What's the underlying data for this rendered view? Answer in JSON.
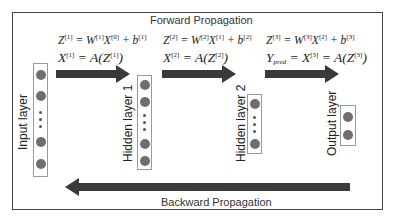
{
  "diagram": {
    "forward_label": "Forward Propagation",
    "backward_label": "Backward Propagation",
    "layers": [
      {
        "label": "Input layer",
        "nodes_top": 2,
        "nodes_bottom": 2,
        "ellipsis": true
      },
      {
        "label": "Hidden layer 1",
        "nodes_top": 2,
        "nodes_bottom": 2,
        "ellipsis": true
      },
      {
        "label": "Hidden layer 2",
        "nodes_top": 1,
        "nodes_bottom": 1,
        "ellipsis": true
      },
      {
        "label": "Output layer",
        "nodes_top": 1,
        "nodes_bottom": 1,
        "ellipsis": false
      }
    ],
    "equations": [
      {
        "line1": "Z[1] = W[1] X[0] + b[1]",
        "line2": "X[1] = A(Z[1])"
      },
      {
        "line1": "Z[2] = W[2] X[1] + b[2]",
        "line2": "X[2] = A(Z[2])"
      },
      {
        "line1": "Z[3] = W[3] X[2] + b[3]",
        "line2": "Y_pred = X[3] = A(Z[3])"
      }
    ],
    "colors": {
      "arrow": "#3a3a3a",
      "node": "#6e6e6e",
      "frame": "#444444"
    }
  }
}
